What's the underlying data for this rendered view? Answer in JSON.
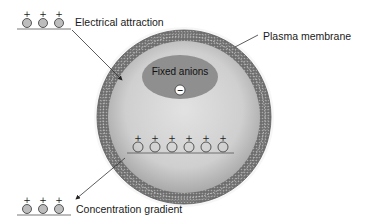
{
  "diagram": {
    "labels": {
      "electrical_attraction": "Electrical attraction",
      "plasma_membrane": "Plasma membrane",
      "fixed_anions": "Fixed anions",
      "concentration_gradient": "Concentration gradient"
    },
    "symbols": {
      "cation_charge": "+",
      "anion_charge": "−"
    },
    "counts": {
      "outside_cations_top": 3,
      "inside_cations": 6,
      "outside_cations_bottom": 3
    },
    "colors": {
      "membrane": "#7a7a7a",
      "cytoplasm_center": "#dcdcdc",
      "cytoplasm_edge": "#b5b5b5",
      "fixed_anion_region": "#8f8f8f",
      "cation_fill": "#bdbdbd",
      "line": "#444444"
    }
  }
}
